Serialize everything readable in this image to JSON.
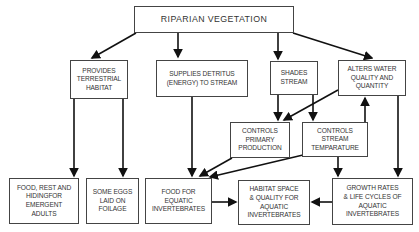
{
  "diagram": {
    "nodes": {
      "riparian": "RIPARIAN  VEGETATION",
      "terrestrial": "PROVIDES\nTERRESTRIAL\nHABITAT",
      "detritus": "SUPPLIES DETRITUS\n(ENERGY) TO STREAM",
      "shades": "SHADES\nSTREAM",
      "alters": "ALTERS WATER\nQUALITY AND\nQUANTITY",
      "primary": "CONTROLS\nPRIMARY\nPRODUCTION",
      "temperature": "CONTROLS\nSTREAM\nTEMPARATURE",
      "food_adults": "FOOD, REST AND\nHIDINGFOR\nEMERGENT\nADULTS",
      "eggs": "SOME EGGS\nLAID ON\nFOILAGE",
      "food_invert": "FOOD FOR\nEQUATIC\nINVERTEBRATES",
      "habitat_space": "HABITAT SPACE\n& QUALITY FOR\nAQUATIC\nINVERTEBRATES",
      "growth": "GROWTH RATES\n& LIFE CYCLES OF\nAQUATIC\nINVERTEBRATES"
    },
    "edges": [
      [
        "riparian",
        "terrestrial"
      ],
      [
        "riparian",
        "detritus"
      ],
      [
        "riparian",
        "shades"
      ],
      [
        "riparian",
        "alters"
      ],
      [
        "terrestrial",
        "food_adults"
      ],
      [
        "terrestrial",
        "eggs"
      ],
      [
        "detritus",
        "food_invert"
      ],
      [
        "shades",
        "primary"
      ],
      [
        "shades",
        "temperature"
      ],
      [
        "alters",
        "primary"
      ],
      [
        "temperature",
        "alters"
      ],
      [
        "alters",
        "growth"
      ],
      [
        "primary",
        "food_invert"
      ],
      [
        "temperature",
        "food_invert"
      ],
      [
        "temperature",
        "growth"
      ],
      [
        "food_invert",
        "habitat_space"
      ],
      [
        "growth",
        "habitat_space"
      ]
    ],
    "line_color": "#1a1a1a"
  }
}
